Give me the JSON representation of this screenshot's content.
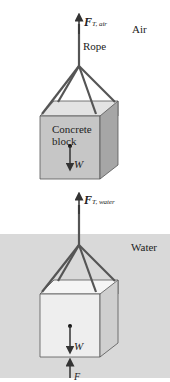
{
  "panels": {
    "air": {
      "medium_label": "Air",
      "force_symbol": "F",
      "force_subscript": "T, air",
      "rope_label": "Rope",
      "block_label_line1": "Concrete",
      "block_label_line2": "block",
      "weight_label": "W"
    },
    "water": {
      "medium_label": "Water",
      "force_symbol": "F",
      "force_subscript": "T, water",
      "weight_label": "W",
      "buoyant_label": "F"
    }
  },
  "colors": {
    "water": "#d9d9d9",
    "block_front": "#c8c8c8",
    "block_top": "#e6e6e6",
    "block_side": "#a8a8a8",
    "block_front_water": "#efefef",
    "block_top_water": "#f6f6f6",
    "block_side_water": "#cfcfcf",
    "rope": "#555555"
  }
}
